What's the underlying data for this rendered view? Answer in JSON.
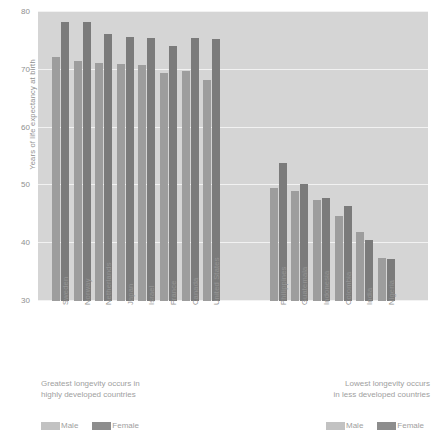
{
  "chart_data": {
    "type": "bar",
    "title": "",
    "xlabel": "",
    "ylabel": "Years of life expectancy at birth",
    "ylim": [
      30,
      80
    ],
    "yticks": [
      30,
      40,
      50,
      60,
      70,
      80
    ],
    "grid": true,
    "legend_position": "bottom",
    "groups": [
      {
        "name": "developed",
        "caption": "Greatest longevity occurs in\nhighly developed countries",
        "categories": [
          "Sweden",
          "Norway",
          "Netherlands",
          "Japan",
          "Israel",
          "France",
          "Canada",
          "United States"
        ],
        "series": [
          {
            "name": "Male",
            "values": [
              72.3,
              71.6,
              71.2,
              71.0,
              70.8,
              69.5,
              69.8,
              68.3
            ]
          },
          {
            "name": "Female",
            "values": [
              78.2,
              78.2,
              76.2,
              75.7,
              75.5,
              74.2,
              75.5,
              75.3
            ]
          }
        ]
      },
      {
        "name": "less-developed",
        "caption": "Lowest longevity occurs\nin less developed countries",
        "categories": [
          "Philippines",
          "Guatemala",
          "Indonesia",
          "Colombia",
          "India",
          "Nigeria"
        ],
        "series": [
          {
            "name": "Male",
            "values": [
              49.6,
              49.1,
              47.5,
              44.7,
              41.9,
              37.5
            ]
          },
          {
            "name": "Female",
            "values": [
              53.9,
              50.2,
              47.8,
              46.5,
              40.6,
              37.2
            ]
          }
        ]
      }
    ],
    "legend": [
      {
        "label": "Male",
        "color": "#c2c2c2"
      },
      {
        "label": "Female",
        "color": "#8d8d8d"
      }
    ],
    "colors": {
      "male_bar": "#9d9d9d",
      "female_bar": "#7b7b7b",
      "plot_background": "#d5d5d5",
      "gridline": "#f2f2f2",
      "text": "#8f8f8f"
    }
  }
}
